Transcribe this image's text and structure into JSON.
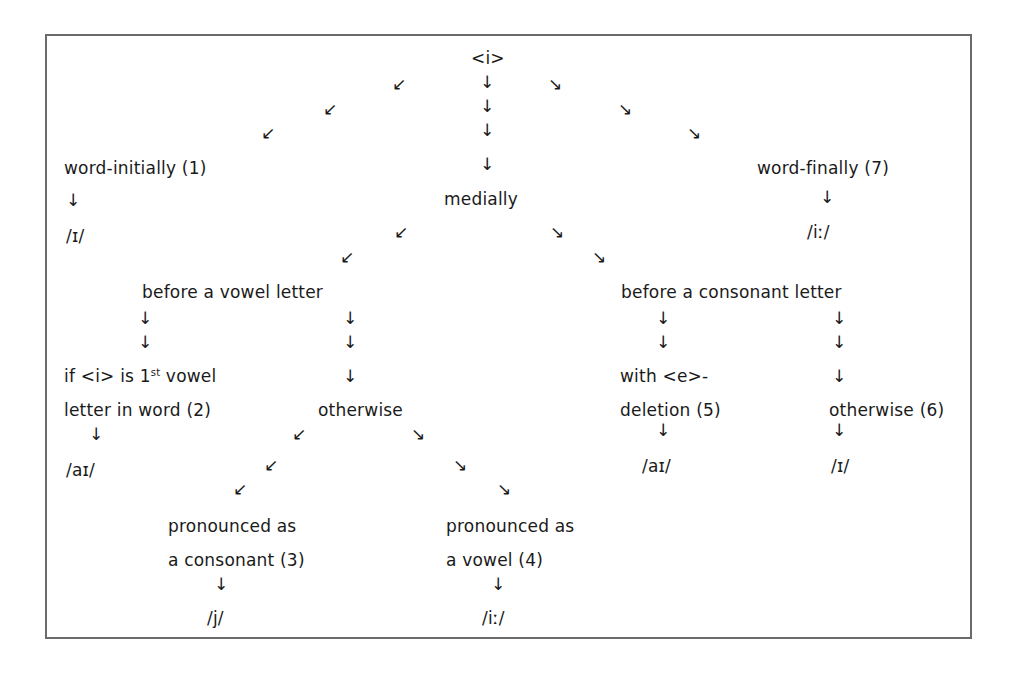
{
  "diagram": {
    "root": {
      "label": "<i>"
    },
    "nodes": {
      "word_initially": "word-initially (1)",
      "medially": "medially",
      "word_finally": "word-finally (7)",
      "before_vowel": "before a vowel letter",
      "before_consonant": "before a consonant letter",
      "first_vowel_line1": "if <i> is 1",
      "first_vowel_sup": "st",
      "first_vowel_line1_rest": " vowel",
      "first_vowel_line2": "letter in word (2)",
      "otherwise_vowel": "otherwise",
      "e_deletion_line1": "with <e>-",
      "e_deletion_line2": "deletion (5)",
      "otherwise_6": "otherwise (6)",
      "consonant_line1": "pronounced as",
      "consonant_line2": "a consonant (3)",
      "vowel_line1": "pronounced as",
      "vowel_line2": "a vowel (4)"
    },
    "outcomes": {
      "word_initially": "/ɪ/",
      "word_finally": "/iː/",
      "first_vowel": "/aɪ/",
      "e_deletion": "/aɪ/",
      "otherwise_6": "/ɪ/",
      "consonant": "/j/",
      "vowel": "/iː/"
    },
    "arrows": {
      "down": "↓",
      "down_left": "↙",
      "down_right": "↘"
    }
  }
}
